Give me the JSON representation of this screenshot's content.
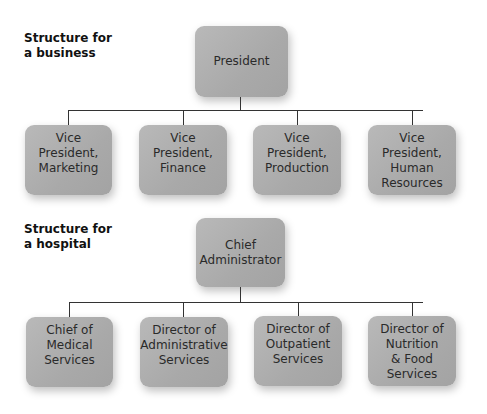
{
  "business": {
    "title": "Structure for\na business",
    "top": "President",
    "children": [
      "Vice\nPresident,\nMarketing",
      "Vice\nPresident,\nFinance",
      "Vice\nPresident,\nProduction",
      "Vice\nPresident,\nHuman\nResources"
    ]
  },
  "hospital": {
    "title": "Structure for\na hospital",
    "top": "Chief\nAdministrator",
    "children": [
      "Chief of\nMedical\nServices",
      "Director of\nAdministrative\nServices",
      "Director of\nOutpatient\nServices",
      "Director of\nNutrition\n& Food\nServices"
    ]
  }
}
